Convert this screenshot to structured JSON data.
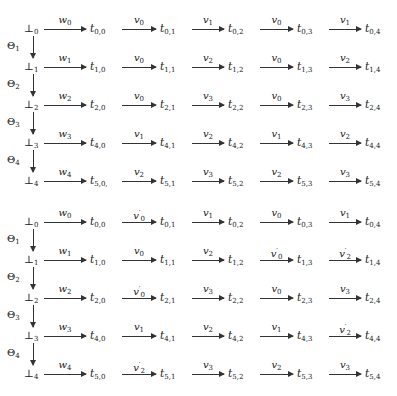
{
  "diagrams": [
    {
      "rows": [
        {
          "start": {
            "sym": "⊥",
            "sub": "0"
          },
          "edges": [
            {
              "label": "w",
              "sub": "0",
              "prime": false,
              "target": "0,0"
            },
            {
              "label": "v",
              "sub": "0",
              "prime": false,
              "target": "0,1"
            },
            {
              "label": "v",
              "sub": "1",
              "prime": false,
              "target": "0,2"
            },
            {
              "label": "v",
              "sub": "0",
              "prime": false,
              "target": "0,3"
            },
            {
              "label": "v",
              "sub": "1",
              "prime": false,
              "target": "0,4"
            }
          ]
        },
        {
          "start": {
            "sym": "⊥",
            "sub": "1"
          },
          "edges": [
            {
              "label": "w",
              "sub": "1",
              "prime": false,
              "target": "1,0"
            },
            {
              "label": "v",
              "sub": "0",
              "prime": false,
              "target": "1,1"
            },
            {
              "label": "v",
              "sub": "2",
              "prime": false,
              "target": "1,2"
            },
            {
              "label": "v",
              "sub": "0",
              "prime": false,
              "target": "1,3"
            },
            {
              "label": "v",
              "sub": "2",
              "prime": false,
              "target": "1,4"
            }
          ]
        },
        {
          "start": {
            "sym": "⊥",
            "sub": "2"
          },
          "edges": [
            {
              "label": "w",
              "sub": "2",
              "prime": false,
              "target": "2,0"
            },
            {
              "label": "v",
              "sub": "0",
              "prime": false,
              "target": "2,1"
            },
            {
              "label": "v",
              "sub": "3",
              "prime": false,
              "target": "2,2"
            },
            {
              "label": "v",
              "sub": "0",
              "prime": false,
              "target": "2,3"
            },
            {
              "label": "v",
              "sub": "3",
              "prime": false,
              "target": "2,4"
            }
          ]
        },
        {
          "start": {
            "sym": "⊥",
            "sub": "3"
          },
          "edges": [
            {
              "label": "w",
              "sub": "3",
              "prime": false,
              "target": "4,0"
            },
            {
              "label": "v",
              "sub": "1",
              "prime": false,
              "target": "4,1"
            },
            {
              "label": "v",
              "sub": "2",
              "prime": false,
              "target": "4,2"
            },
            {
              "label": "v",
              "sub": "1",
              "prime": false,
              "target": "4,3"
            },
            {
              "label": "v",
              "sub": "2",
              "prime": false,
              "target": "4,4"
            }
          ]
        },
        {
          "start": {
            "sym": "⊥",
            "sub": "4"
          },
          "edges": [
            {
              "label": "w",
              "sub": "4",
              "prime": false,
              "target": "5,0,"
            },
            {
              "label": "v",
              "sub": "2",
              "prime": false,
              "target": "5,1"
            },
            {
              "label": "v",
              "sub": "3",
              "prime": false,
              "target": "5,2"
            },
            {
              "label": "v",
              "sub": "2",
              "prime": false,
              "target": "5,3"
            },
            {
              "label": "v",
              "sub": "3",
              "prime": false,
              "target": "5,4"
            }
          ]
        }
      ],
      "verticals": [
        {
          "label": "Θ",
          "sub": "1"
        },
        {
          "label": "Θ",
          "sub": "2"
        },
        {
          "label": "Θ",
          "sub": "3"
        },
        {
          "label": "Θ",
          "sub": "4"
        }
      ]
    },
    {
      "rows": [
        {
          "start": {
            "sym": "⊥",
            "sub": "0"
          },
          "edges": [
            {
              "label": "w",
              "sub": "0",
              "prime": false,
              "target": "0,0"
            },
            {
              "label": "v",
              "sub": "0",
              "prime": true,
              "target": "0,1"
            },
            {
              "label": "v",
              "sub": "1",
              "prime": false,
              "target": "0,2"
            },
            {
              "label": "v",
              "sub": "0",
              "prime": false,
              "target": "0,3"
            },
            {
              "label": "v",
              "sub": "1",
              "prime": false,
              "target": "0,4"
            }
          ]
        },
        {
          "start": {
            "sym": "⊥",
            "sub": "1"
          },
          "edges": [
            {
              "label": "w",
              "sub": "1",
              "prime": false,
              "target": "1,0"
            },
            {
              "label": "v",
              "sub": "0",
              "prime": false,
              "target": "1,1"
            },
            {
              "label": "v",
              "sub": "2",
              "prime": false,
              "target": "1,2"
            },
            {
              "label": "v",
              "sub": "0",
              "prime": true,
              "target": "1,3"
            },
            {
              "label": "v",
              "sub": "2",
              "prime": true,
              "target": "1,4"
            }
          ]
        },
        {
          "start": {
            "sym": "⊥",
            "sub": "2"
          },
          "edges": [
            {
              "label": "w",
              "sub": "2",
              "prime": false,
              "target": "2,0"
            },
            {
              "label": "v",
              "sub": "0",
              "prime": true,
              "target": "2,1"
            },
            {
              "label": "v",
              "sub": "3",
              "prime": false,
              "target": "2,2"
            },
            {
              "label": "v",
              "sub": "0",
              "prime": false,
              "target": "2,3"
            },
            {
              "label": "v",
              "sub": "3",
              "prime": false,
              "target": "2,4"
            }
          ]
        },
        {
          "start": {
            "sym": "⊥",
            "sub": "3"
          },
          "edges": [
            {
              "label": "w",
              "sub": "3",
              "prime": false,
              "target": "4,0"
            },
            {
              "label": "v",
              "sub": "1",
              "prime": false,
              "target": "4,1"
            },
            {
              "label": "v",
              "sub": "2",
              "prime": false,
              "target": "4,2"
            },
            {
              "label": "v",
              "sub": "1",
              "prime": false,
              "target": "4,3"
            },
            {
              "label": "v",
              "sub": "2",
              "prime": true,
              "target": "4,4"
            }
          ]
        },
        {
          "start": {
            "sym": "⊥",
            "sub": "4"
          },
          "edges": [
            {
              "label": "w",
              "sub": "4",
              "prime": false,
              "target": "5,0"
            },
            {
              "label": "v",
              "sub": "2",
              "prime": true,
              "target": "5,1"
            },
            {
              "label": "v",
              "sub": "3",
              "prime": false,
              "target": "5,2"
            },
            {
              "label": "v",
              "sub": "2",
              "prime": false,
              "target": "5,3"
            },
            {
              "label": "v",
              "sub": "3",
              "prime": false,
              "target": "5,4"
            }
          ]
        }
      ],
      "verticals": [
        {
          "label": "Θ",
          "sub": "1"
        },
        {
          "label": "Θ",
          "sub": "2"
        },
        {
          "label": "Θ",
          "sub": "3"
        },
        {
          "label": "Θ",
          "sub": "4"
        }
      ]
    }
  ],
  "node_prefix": "t"
}
